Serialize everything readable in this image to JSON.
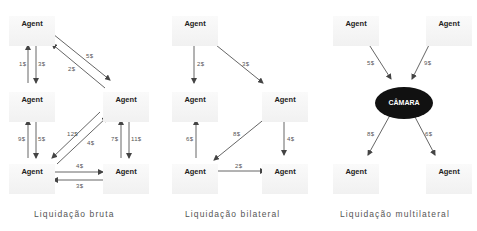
{
  "panels": [
    {
      "caption": "Liquidação bruta",
      "agents": [
        "Agent",
        "Agent",
        "Agent",
        "Agent",
        "Agent"
      ],
      "flows": [
        {
          "from": "top-left",
          "to": "mid-left",
          "label": "3$"
        },
        {
          "from": "mid-left",
          "to": "top-left",
          "label": "1$"
        },
        {
          "from": "top-left",
          "to": "mid-right",
          "label": "5$"
        },
        {
          "from": "mid-right",
          "to": "top-left",
          "label": "2$"
        },
        {
          "from": "bottom-left",
          "to": "mid-left",
          "label": "9$"
        },
        {
          "from": "mid-left",
          "to": "bottom-left",
          "label": "5$"
        },
        {
          "from": "mid-right",
          "to": "bottom-left",
          "label": "12$"
        },
        {
          "from": "bottom-left",
          "to": "mid-right",
          "label": "4$"
        },
        {
          "from": "bottom-right",
          "to": "mid-right",
          "label": "7$"
        },
        {
          "from": "mid-right",
          "to": "bottom-right",
          "label": "11$"
        },
        {
          "from": "bottom-left",
          "to": "bottom-right",
          "label": "4$"
        },
        {
          "from": "bottom-right",
          "to": "bottom-left",
          "label": "3$"
        }
      ]
    },
    {
      "caption": "Liquidação bilateral",
      "agents": [
        "Agent",
        "Agent",
        "Agent",
        "Agent",
        "Agent"
      ],
      "flows": [
        {
          "from": "top-left",
          "to": "mid-left",
          "label": "2$"
        },
        {
          "from": "top-left",
          "to": "mid-right",
          "label": "3$"
        },
        {
          "from": "bottom-left",
          "to": "mid-left",
          "label": "6$"
        },
        {
          "from": "mid-right",
          "to": "bottom-left",
          "label": "8$"
        },
        {
          "from": "mid-right",
          "to": "bottom-right",
          "label": "4$"
        },
        {
          "from": "bottom-left",
          "to": "bottom-right",
          "label": "2$"
        }
      ]
    },
    {
      "caption": "Liquidação multilateral",
      "hub": "CÂMARA",
      "agents": [
        "Agent",
        "Agent",
        "Agent",
        "Agent"
      ],
      "flows": [
        {
          "from": "top-left",
          "to": "hub",
          "label": "5$"
        },
        {
          "from": "top-right",
          "to": "hub",
          "label": "9$"
        },
        {
          "from": "hub",
          "to": "bottom-left",
          "label": "8$"
        },
        {
          "from": "hub",
          "to": "bottom-right",
          "label": "6$"
        }
      ]
    }
  ],
  "colors": {
    "arrow": "#444444",
    "hub_fill": "#111111",
    "hub_text": "#ffffff",
    "agent_bg": "#f3f3f3"
  }
}
